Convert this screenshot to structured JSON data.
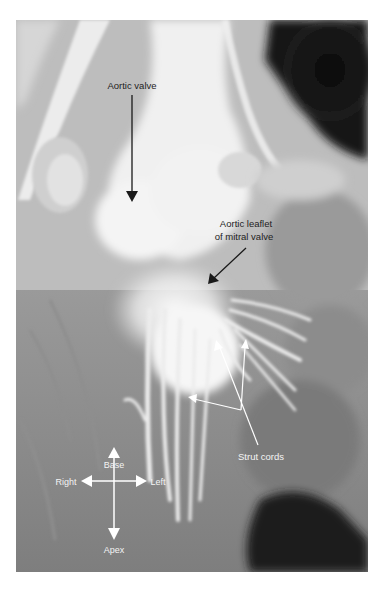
{
  "figure": {
    "type": "grayscale anatomical photograph",
    "labels": {
      "aortic_valve": "Aortic valve",
      "mitral_leaflet_line1": "Aortic leaflet",
      "mitral_leaflet_line2": "of mitral valve",
      "strut_cords": "Strut cords"
    },
    "orientation": {
      "up": "Base",
      "down": "Apex",
      "left": "Right",
      "right": "Left"
    },
    "colors": {
      "background": "#ffffff",
      "dark_label": "#1e1e1e",
      "light_label": "#f4f4f4"
    }
  }
}
